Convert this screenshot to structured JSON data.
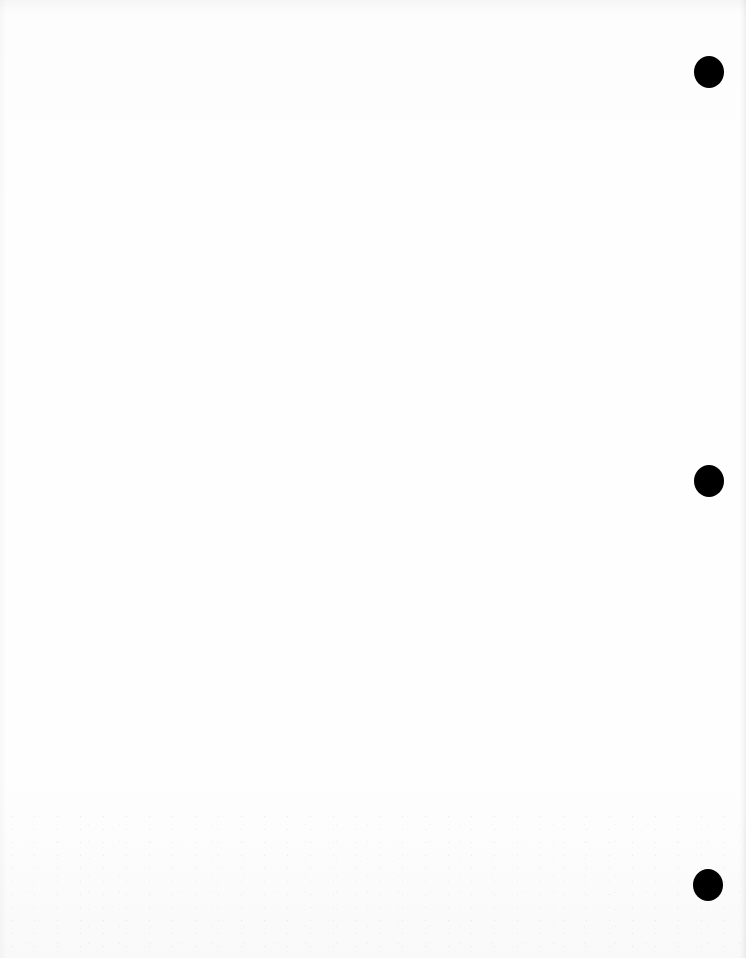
{
  "document": {
    "type": "blank three-hole-punched sheet",
    "paper_color": "#fdfdfd",
    "text_content": "",
    "punch_holes": [
      {
        "label": "top",
        "cx": 709,
        "cy": 72,
        "width": 30,
        "height": 32,
        "color": "#000000"
      },
      {
        "label": "middle",
        "cx": 709,
        "cy": 481,
        "width": 30,
        "height": 32,
        "color": "#000000"
      },
      {
        "label": "bottom",
        "cx": 708,
        "cy": 885,
        "width": 30,
        "height": 32,
        "color": "#000000"
      }
    ]
  }
}
